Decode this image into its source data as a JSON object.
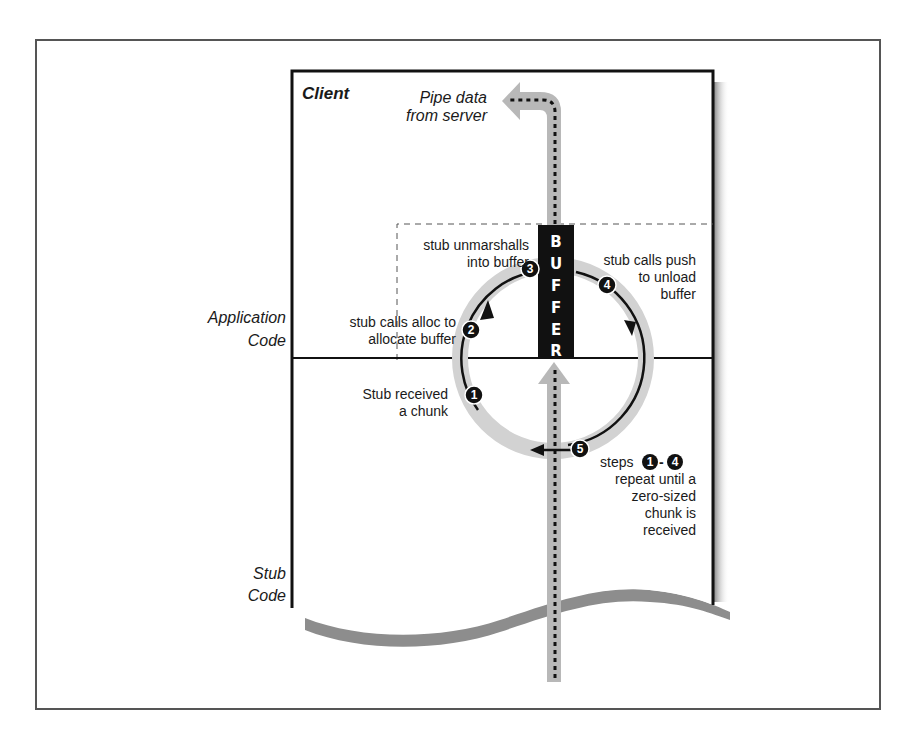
{
  "diagram": {
    "client_title": "Client",
    "pipe_label": [
      "Pipe data",
      "from server"
    ],
    "buffer_label": [
      "B",
      "U",
      "F",
      "F",
      "E",
      "R"
    ],
    "regions": {
      "application_code": [
        "Application",
        "Code"
      ],
      "stub_code": [
        "Stub",
        "Code"
      ]
    },
    "steps": [
      {
        "number": "1",
        "text": [
          "Stub received",
          "a chunk"
        ]
      },
      {
        "number": "2",
        "text": [
          "stub calls alloc to",
          "allocate buffer"
        ]
      },
      {
        "number": "3",
        "text": [
          "stub unmarshalls",
          "into buffer"
        ]
      },
      {
        "number": "4",
        "text": [
          "stub calls push",
          "to unload",
          "buffer"
        ]
      },
      {
        "number": "5",
        "text": []
      }
    ],
    "repeat_note": {
      "prefix": "steps",
      "from": "1",
      "dash": "-",
      "to": "4",
      "lines": [
        "repeat until a",
        "zero-sized",
        "chunk is",
        "received"
      ]
    },
    "colors": {
      "ink": "#111111",
      "gray_path": "#b8b8b8",
      "ring": "#d0d0d0",
      "shadow": "#8a8a8a",
      "frame": "#555555"
    }
  }
}
